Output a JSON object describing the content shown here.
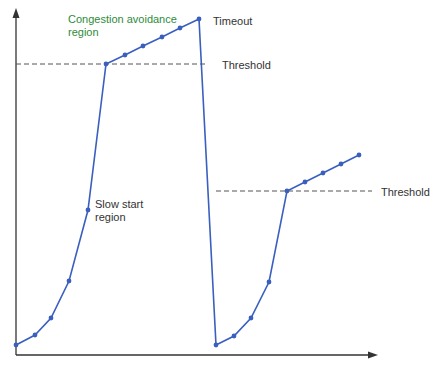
{
  "chart_data": {
    "type": "line",
    "title": "",
    "xlabel": "",
    "ylabel": "",
    "grid": false,
    "series": [
      {
        "name": "congestion-window-1",
        "points_px": [
          [
            16,
            345
          ],
          [
            35,
            335
          ],
          [
            51,
            318
          ],
          [
            69,
            281
          ],
          [
            88,
            210
          ],
          [
            106,
            64
          ],
          [
            125,
            55
          ],
          [
            143,
            46
          ],
          [
            162,
            37
          ],
          [
            180,
            28
          ],
          [
            199,
            19
          ],
          [
            216,
            345
          ]
        ]
      },
      {
        "name": "congestion-window-2",
        "points_px": [
          [
            216,
            345
          ],
          [
            234,
            336
          ],
          [
            251,
            318
          ],
          [
            269,
            282
          ],
          [
            287,
            191
          ],
          [
            305,
            182
          ],
          [
            323,
            173
          ],
          [
            341,
            164
          ],
          [
            359,
            155
          ]
        ]
      }
    ],
    "thresholds": [
      {
        "label": "Threshold",
        "y_px": 64,
        "x_start": 16,
        "x_end": 208
      },
      {
        "label": "Threshold",
        "y_px": 191,
        "x_start": 216,
        "x_end": 372
      }
    ],
    "annotations": [
      {
        "text": "Congestion avoidance",
        "x": 68,
        "y": 13
      },
      {
        "text": "region",
        "x": 68,
        "y": 26
      },
      {
        "text": "Timeout",
        "x": 213,
        "y": 15
      },
      {
        "text": "Slow start",
        "x": 95,
        "y": 198
      },
      {
        "text": "region",
        "x": 95,
        "y": 211
      }
    ]
  },
  "labels": {
    "congestion_line1": "Congestion avoidance",
    "congestion_line2": "region",
    "timeout": "Timeout",
    "threshold_1": "Threshold",
    "threshold_2": "Threshold",
    "slow_start_line1": "Slow start",
    "slow_start_line2": "region"
  },
  "colors": {
    "line": "#3a5fbf",
    "axis": "#333333",
    "threshold": "#555555",
    "label_green": "#2e8b3a"
  }
}
